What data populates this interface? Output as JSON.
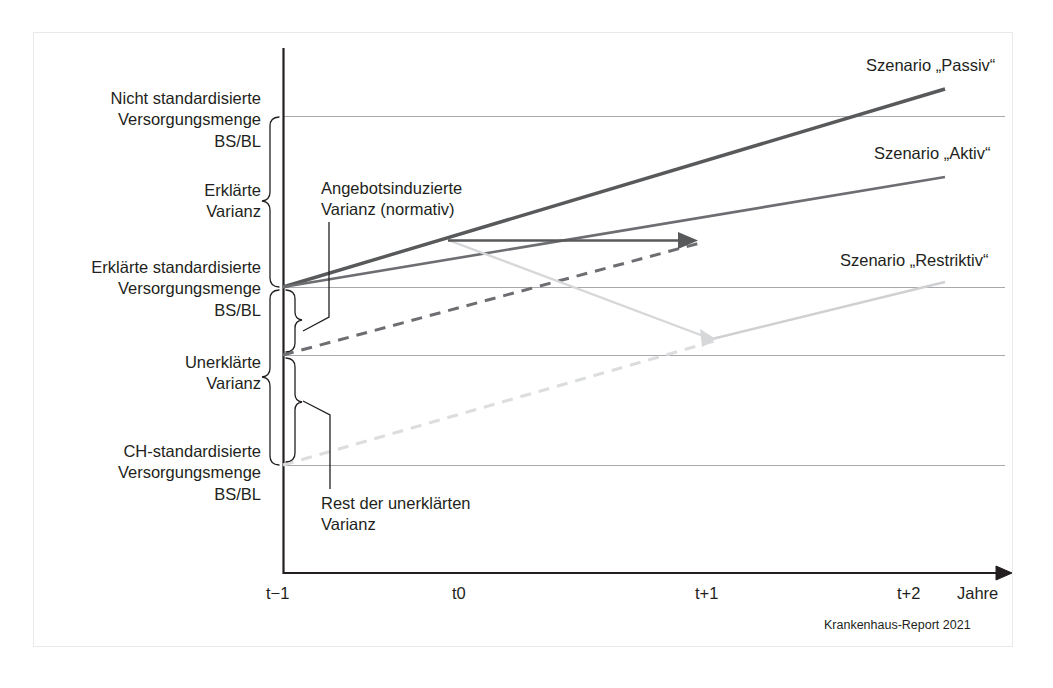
{
  "figure": {
    "source_note": "Krankenhaus-Report 2021",
    "axis": {
      "x_title": "Jahre",
      "ticks": [
        "t−1",
        "t0",
        "t+1",
        "t+2"
      ]
    },
    "left_labels": [
      {
        "id": "nicht-standardisierte",
        "lines": [
          "Nicht standardisierte",
          "Versorgungsmenge",
          "BS/BL"
        ]
      },
      {
        "id": "erklaerte-varianz",
        "lines": [
          "Erklärte",
          "Varianz"
        ]
      },
      {
        "id": "erklaerte-standardisierte",
        "lines": [
          "Erklärte standardisierte",
          "Versorgungsmenge",
          "BS/BL"
        ]
      },
      {
        "id": "unerklaerte-varianz",
        "lines": [
          "Unerklärte",
          "Varianz"
        ]
      },
      {
        "id": "ch-standardisierte",
        "lines": [
          "CH-standardisierte",
          "Versorgungsmenge",
          "BS/BL"
        ]
      }
    ],
    "annotations": [
      {
        "id": "angebotsinduzierte",
        "lines": [
          "Angebotsinduzierte",
          "Varianz (normativ)"
        ]
      },
      {
        "id": "rest-unerklaerte",
        "lines": [
          "Rest der unerklärten",
          "Varianz"
        ]
      }
    ],
    "scenarios": [
      {
        "id": "passiv",
        "label": "Szenario „Passiv“",
        "color": "#58595b",
        "style": "solid"
      },
      {
        "id": "aktiv",
        "label": "Szenario „Aktiv“",
        "color": "#6d6e71",
        "style": "solid"
      },
      {
        "id": "restriktiv",
        "label": "Szenario „Restriktiv“",
        "color": "#cfd0d2",
        "style": "solid"
      }
    ],
    "colors": {
      "text": "#231f20",
      "axis": "#231f20",
      "gridline": "#a7a9ac",
      "frame": "#e9e9ec",
      "dark_line": "#58595b",
      "mid_line": "#6d6e71",
      "light_line": "#cfd0d2",
      "dashed_dark": "#6d6e71",
      "dashed_light": "#dcdddf"
    }
  }
}
